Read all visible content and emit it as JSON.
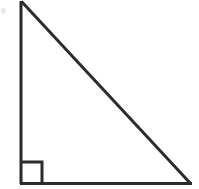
{
  "figure": {
    "kind": "geometry-diagram",
    "shape_name": "right triangle",
    "canvas": {
      "width": 199,
      "height": 189,
      "background": "#ffffff"
    },
    "stroke": {
      "color": "#2b2b2b",
      "width": 3
    },
    "vertices": {
      "apex": {
        "x": 21,
        "y": 2
      },
      "right_angle": {
        "x": 21,
        "y": 183
      },
      "base_end": {
        "x": 191,
        "y": 183
      }
    },
    "sides": [
      {
        "name": "vertical-leg",
        "from": "apex",
        "to": "right_angle"
      },
      {
        "name": "horizontal-leg",
        "from": "right_angle",
        "to": "base_end"
      },
      {
        "name": "hypotenuse",
        "from": "apex",
        "to": "base_end"
      }
    ],
    "right_angle_marker": {
      "at": "right_angle",
      "size": 21,
      "x": 21,
      "y": 162,
      "stroke_width": 3
    },
    "artifact": {
      "name": "scan-smudge",
      "x": 1,
      "y": 8,
      "width": 5,
      "height": 6,
      "color": "#e9e9e9"
    },
    "labels": [],
    "alt_text": "A right triangle with the right angle at the lower left, marked by a small square."
  }
}
